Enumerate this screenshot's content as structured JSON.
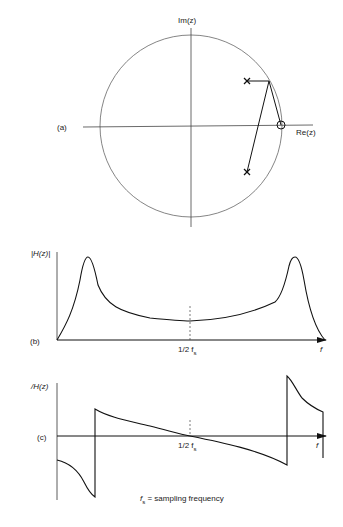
{
  "panel_a": {
    "label": "(a)",
    "im_axis": "Im(z)",
    "re_axis": "Re(z)",
    "poles": 2,
    "zeros": 1
  },
  "panel_b": {
    "label": "(b)",
    "y_axis": "|H(z)|",
    "x_axis": "f",
    "mid_tick": "1/2 f",
    "mid_tick_sub": "s"
  },
  "panel_c": {
    "label": "(c)",
    "y_axis": "/H(z)",
    "x_axis": "f",
    "mid_tick": "1/2 f",
    "mid_tick_sub": "s"
  },
  "footnote": {
    "symbol": "f",
    "sub": "s",
    "text": " = sampling frequency"
  }
}
